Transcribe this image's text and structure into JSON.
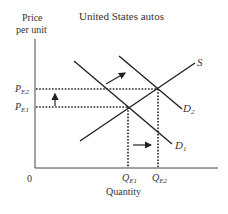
{
  "title": "United States autos",
  "y_axis_label_line1": "Price",
  "y_axis_label_line2": "per unit",
  "x_axis_label": "Quantity",
  "origin_label": "0",
  "curves": {
    "supply": {
      "label": "S"
    },
    "demand_initial": {
      "label": "D",
      "sub": "1"
    },
    "demand_shifted": {
      "label": "D",
      "sub": "2"
    }
  },
  "price_levels": [
    {
      "label": "P",
      "sub": "E2"
    },
    {
      "label": "P",
      "sub": "E1"
    }
  ],
  "quantity_levels": [
    {
      "label": "Q",
      "sub": "E1"
    },
    {
      "label": "Q",
      "sub": "E2"
    }
  ],
  "arrows": {
    "demand_shift": "rightward-up",
    "price_increase": "up",
    "quantity_increase": "right"
  },
  "colors": {
    "line": "#222222",
    "text": "#333333"
  }
}
